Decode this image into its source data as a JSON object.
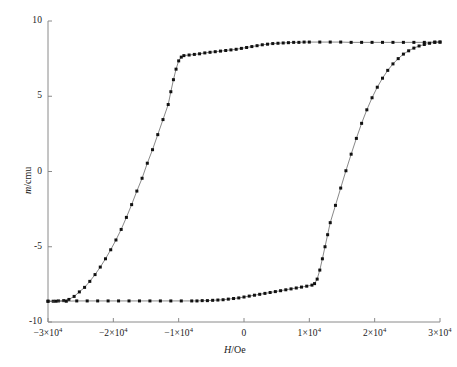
{
  "chart_data": {
    "type": "line",
    "title": "",
    "subtitle": "",
    "xlabel_parts": {
      "italic": "H",
      "plain": "/Oe"
    },
    "ylabel_parts": {
      "italic": "m",
      "plain": "/cmu"
    },
    "xlabel": "H/Oe",
    "ylabel": "m/cmu",
    "xlim": [
      -30000,
      30000
    ],
    "ylim": [
      -10,
      10
    ],
    "xticks": [
      -30000,
      -20000,
      -10000,
      0,
      10000,
      20000,
      30000
    ],
    "xtick_labels": [
      "-3×10⁴",
      "-2×10⁴",
      "-1×10⁴",
      "0",
      "1×10⁴",
      "2×10⁴",
      "3×10⁴"
    ],
    "yticks": [
      -10,
      -5,
      0,
      5,
      10
    ],
    "ytick_labels": [
      "-10",
      "-5",
      "0",
      "5",
      "10"
    ],
    "grid": false,
    "legend": false,
    "legend_position": "none",
    "marker": "filled-square",
    "marker_color": "#111111",
    "line_color": "#555555",
    "axis_color": "#8a8a8a",
    "background_color": "#ffffff",
    "annotations": [],
    "series": [
      {
        "name": "ascending-branch",
        "description": "Lower-to-upper sweep: saturates negative at low field, switches near -1.7e4 Oe, saturates positive at high field",
        "points": [
          [
            -30000,
            -8.62
          ],
          [
            -29200,
            -8.62
          ],
          [
            -28400,
            -8.6
          ],
          [
            -27600,
            -8.58
          ],
          [
            -26800,
            -8.5
          ],
          [
            -26000,
            -8.3
          ],
          [
            -25200,
            -8.0
          ],
          [
            -24400,
            -7.7
          ],
          [
            -23600,
            -7.3
          ],
          [
            -22800,
            -6.85
          ],
          [
            -22000,
            -6.35
          ],
          [
            -21200,
            -5.8
          ],
          [
            -20400,
            -5.2
          ],
          [
            -19600,
            -4.55
          ],
          [
            -18800,
            -3.85
          ],
          [
            -18000,
            -3.05
          ],
          [
            -17200,
            -2.2
          ],
          [
            -16400,
            -1.3
          ],
          [
            -15600,
            -0.45
          ],
          [
            -14800,
            0.55
          ],
          [
            -14000,
            1.45
          ],
          [
            -13200,
            2.45
          ],
          [
            -12400,
            3.45
          ],
          [
            -11600,
            4.45
          ],
          [
            -11200,
            5.3
          ],
          [
            -10800,
            6.1
          ],
          [
            -10400,
            6.8
          ],
          [
            -10000,
            7.35
          ],
          [
            -9600,
            7.6
          ],
          [
            -9200,
            7.7
          ],
          [
            -8400,
            7.74
          ],
          [
            -7600,
            7.78
          ],
          [
            -6800,
            7.82
          ],
          [
            -6000,
            7.88
          ],
          [
            -5200,
            7.92
          ],
          [
            -4400,
            7.96
          ],
          [
            -3600,
            8.0
          ],
          [
            -2800,
            8.04
          ],
          [
            -2000,
            8.08
          ],
          [
            -1200,
            8.12
          ],
          [
            -400,
            8.18
          ],
          [
            400,
            8.24
          ],
          [
            1200,
            8.3
          ],
          [
            2000,
            8.36
          ],
          [
            2800,
            8.42
          ],
          [
            3600,
            8.46
          ],
          [
            4400,
            8.5
          ],
          [
            5200,
            8.52
          ],
          [
            6000,
            8.54
          ],
          [
            6800,
            8.56
          ],
          [
            7600,
            8.58
          ],
          [
            8400,
            8.58
          ],
          [
            9200,
            8.6
          ],
          [
            10000,
            8.6
          ],
          [
            11600,
            8.6
          ],
          [
            13200,
            8.6
          ],
          [
            14800,
            8.6
          ],
          [
            16400,
            8.58
          ],
          [
            18000,
            8.58
          ],
          [
            19600,
            8.58
          ],
          [
            21200,
            8.58
          ],
          [
            22800,
            8.58
          ],
          [
            24400,
            8.58
          ],
          [
            26000,
            8.58
          ],
          [
            27600,
            8.58
          ],
          [
            29200,
            8.6
          ],
          [
            30000,
            8.6
          ]
        ]
      },
      {
        "name": "descending-branch",
        "description": "Upper-to-lower sweep: saturates positive at high field, drops near +1.7e4 Oe, saturates negative at low field",
        "points": [
          [
            30000,
            8.6
          ],
          [
            29200,
            8.58
          ],
          [
            28400,
            8.52
          ],
          [
            27600,
            8.44
          ],
          [
            26800,
            8.34
          ],
          [
            26000,
            8.2
          ],
          [
            25200,
            8.02
          ],
          [
            24400,
            7.8
          ],
          [
            23600,
            7.5
          ],
          [
            22800,
            7.15
          ],
          [
            22000,
            6.72
          ],
          [
            21200,
            6.2
          ],
          [
            20400,
            5.6
          ],
          [
            19600,
            4.9
          ],
          [
            18800,
            4.1
          ],
          [
            18000,
            3.2
          ],
          [
            17200,
            2.2
          ],
          [
            16400,
            1.15
          ],
          [
            15600,
            0.05
          ],
          [
            14800,
            -1.1
          ],
          [
            14000,
            -2.25
          ],
          [
            13200,
            -3.4
          ],
          [
            12800,
            -4.2
          ],
          [
            12400,
            -5.0
          ],
          [
            12000,
            -5.8
          ],
          [
            11600,
            -6.55
          ],
          [
            11200,
            -7.15
          ],
          [
            10800,
            -7.45
          ],
          [
            10400,
            -7.55
          ],
          [
            9600,
            -7.62
          ],
          [
            8800,
            -7.68
          ],
          [
            8000,
            -7.74
          ],
          [
            7200,
            -7.8
          ],
          [
            6400,
            -7.86
          ],
          [
            5600,
            -7.92
          ],
          [
            4800,
            -7.98
          ],
          [
            4000,
            -8.04
          ],
          [
            3200,
            -8.1
          ],
          [
            2400,
            -8.16
          ],
          [
            1600,
            -8.22
          ],
          [
            800,
            -8.28
          ],
          [
            0,
            -8.34
          ],
          [
            -800,
            -8.4
          ],
          [
            -1600,
            -8.44
          ],
          [
            -2400,
            -8.48
          ],
          [
            -3200,
            -8.52
          ],
          [
            -4000,
            -8.54
          ],
          [
            -4800,
            -8.56
          ],
          [
            -5600,
            -8.58
          ],
          [
            -6400,
            -8.58
          ],
          [
            -7200,
            -8.6
          ],
          [
            -8000,
            -8.6
          ],
          [
            -9600,
            -8.6
          ],
          [
            -11200,
            -8.6
          ],
          [
            -12800,
            -8.6
          ],
          [
            -14400,
            -8.6
          ],
          [
            -16000,
            -8.6
          ],
          [
            -17600,
            -8.6
          ],
          [
            -19200,
            -8.6
          ],
          [
            -20800,
            -8.6
          ],
          [
            -22400,
            -8.6
          ],
          [
            -24000,
            -8.6
          ],
          [
            -25600,
            -8.6
          ],
          [
            -27200,
            -8.62
          ],
          [
            -28800,
            -8.62
          ],
          [
            -30000,
            -8.62
          ]
        ]
      }
    ]
  },
  "plot_geometry": {
    "left": 48,
    "right": 440,
    "top": 21,
    "bottom": 322
  }
}
